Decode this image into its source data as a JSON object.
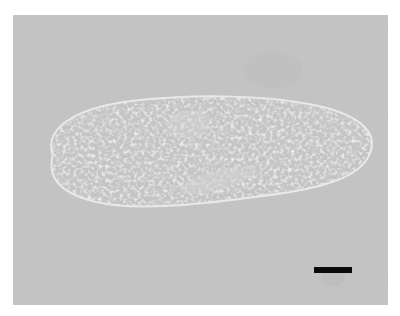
{
  "figure": {
    "background_color": "#c4c4c4",
    "cell_color": "#d0d0d0",
    "granule_color": "#b2b2b2",
    "scale_bar": {
      "color": "#0a0a0a",
      "label": ""
    }
  }
}
